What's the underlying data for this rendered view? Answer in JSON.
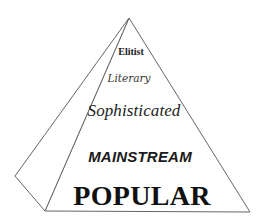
{
  "diagram": {
    "type": "pyramid",
    "line_color": "#666666",
    "text_color": "#1a1a1a",
    "tiers": [
      {
        "label": "Elitist",
        "level": 1
      },
      {
        "label": "Literary",
        "level": 2
      },
      {
        "label": "Sophisticated",
        "level": 3
      },
      {
        "label": "MAINSTREAM",
        "level": 4
      },
      {
        "label": "POPULAR",
        "level": 5
      }
    ]
  }
}
